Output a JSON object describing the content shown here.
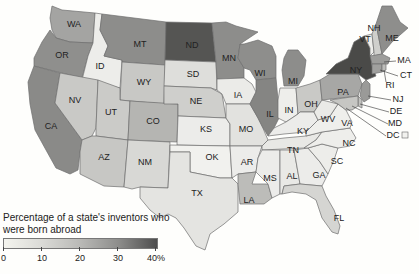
{
  "legend": {
    "title_line1": "Percentage of a state's inventors who",
    "title_line2": "were born abroad",
    "ticks": [
      "0",
      "10",
      "20",
      "30",
      "40%"
    ],
    "scale_min": 0,
    "scale_max": 40,
    "color_min": "#f4f4ee",
    "color_max": "#4d4d4d"
  },
  "states": {
    "WA": "WA",
    "OR": "OR",
    "CA": "CA",
    "ID": "ID",
    "NV": "NV",
    "MT": "MT",
    "WY": "WY",
    "UT": "UT",
    "AZ": "AZ",
    "CO": "CO",
    "NM": "NM",
    "ND": "ND",
    "SD": "SD",
    "NE": "NE",
    "KS": "KS",
    "OK": "OK",
    "TX": "TX",
    "MN": "MN",
    "IA": "IA",
    "MO": "MO",
    "AR": "AR",
    "LA": "LA",
    "WI": "WI",
    "IL": "IL",
    "MI": "MI",
    "IN": "IN",
    "OH": "OH",
    "KY": "KY",
    "TN": "TN",
    "MS": "MS",
    "AL": "AL",
    "GA": "GA",
    "FL": "FL",
    "SC": "SC",
    "NC": "NC",
    "VA": "VA",
    "WV": "WV",
    "PA": "PA",
    "NY": "NY",
    "VT": "VT",
    "NH": "NH",
    "ME": "ME",
    "MA": "MA",
    "CT": "CT",
    "RI": "RI",
    "NJ": "NJ",
    "DE": "DE",
    "MD": "MD",
    "DC": "DC"
  },
  "shading": {
    "darkest": [
      "NY",
      "ND"
    ],
    "dark": [
      "CA",
      "MN",
      "WI",
      "IL",
      "MI",
      "NJ",
      "MA",
      "CT",
      "ME",
      "WA",
      "MT",
      "OR",
      "PA"
    ],
    "medium": [
      "CO",
      "AZ",
      "NV",
      "TX",
      "LA",
      "OH",
      "DE",
      "MD",
      "RI",
      "NH",
      "UT",
      "NM",
      "FL",
      "NE",
      "WY",
      "SD"
    ],
    "light": [
      "ID",
      "IA",
      "KS",
      "OK",
      "MO",
      "AR",
      "IN",
      "KY",
      "TN",
      "MS",
      "AL",
      "GA",
      "SC",
      "NC",
      "VA",
      "WV",
      "VT",
      "DC"
    ]
  }
}
